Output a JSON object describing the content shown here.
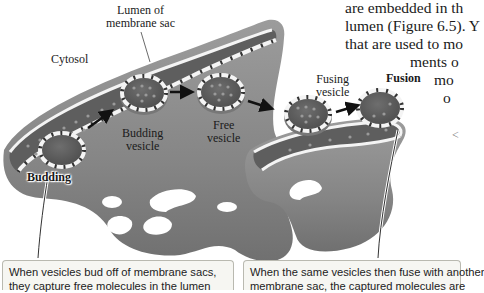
{
  "body_text": {
    "lines": [
      "are embedded in th",
      "lumen (Figure 6.5). Y",
      "that are used to mo",
      "ments o",
      "mo",
      "o",
      "<"
    ]
  },
  "figure": {
    "labels": {
      "lumen": "Lumen of",
      "lumen_line2": "membrane sac",
      "cytosol": "Cytosol",
      "budding_vesicle": "Budding",
      "budding_vesicle_line2": "vesicle",
      "free_vesicle": "Free",
      "free_vesicle_line2": "vesicle",
      "fusing_vesicle": "Fusing",
      "fusing_vesicle_line2": "vesicle",
      "fusion": "Fusion",
      "budding": "Budding"
    },
    "colors": {
      "membrane_gray": "#8a8a8a",
      "lumen_dark": "#5e5e5e",
      "vesicle_dot": "#9a9a9a",
      "membrane_white": "#f4f4f4",
      "protein_dark": "#333333"
    }
  },
  "callouts": {
    "left": {
      "line1": "When vesicles bud off of membrane sacs,",
      "line2": "they capture free molecules in the lumen"
    },
    "right": {
      "line1": "When the same vesicles then fuse with another",
      "line2": "membrane sac, the captured molecules are"
    }
  }
}
